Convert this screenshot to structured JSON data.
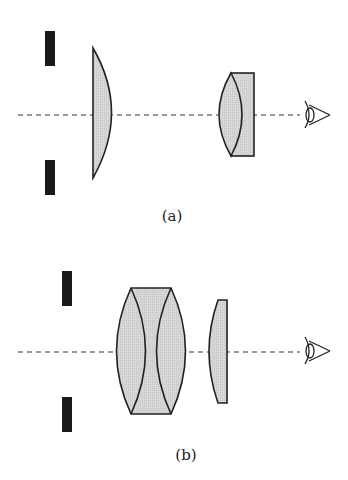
{
  "diagram": {
    "type": "optical-schematic",
    "colors": {
      "glass_fill": "#d6d6d6",
      "stroke": "#222222",
      "aperture": "#1a1a1a",
      "axis": "#333333"
    },
    "panels": [
      {
        "label": "(a)",
        "elements": [
          "aperture-stop",
          "plano-convex-lens",
          "cemented-doublet-eyepiece",
          "eye"
        ]
      },
      {
        "label": "(b)",
        "elements": [
          "aperture-stop",
          "thick-lens-group",
          "plano-convex-lens",
          "eye"
        ]
      }
    ]
  }
}
